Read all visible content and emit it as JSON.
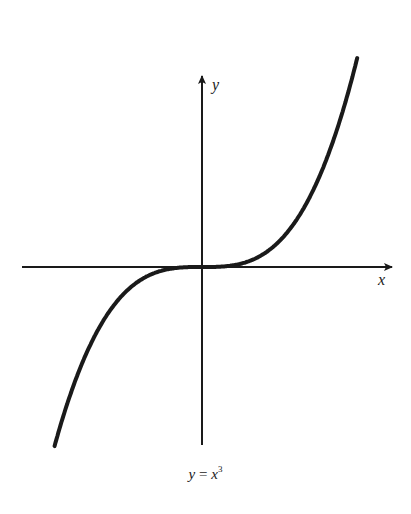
{
  "chart_data": {
    "type": "line",
    "title_parts": {
      "lhs": "y",
      "eq": " = ",
      "base": "x",
      "exp": "3"
    },
    "xlabel": "x",
    "ylabel": "y",
    "function": "y = x^3",
    "grid": false,
    "ticks": false,
    "axes_through_origin": true,
    "x": [
      -1.6,
      -1.2,
      -0.8,
      -0.4,
      0,
      0.4,
      0.8,
      1.2,
      1.6
    ],
    "y": [
      -4.096,
      -1.728,
      -0.512,
      -0.064,
      0,
      0.064,
      0.512,
      1.728,
      4.096
    ],
    "xlim": [
      -1.6,
      1.6
    ],
    "ylim": [
      -4.1,
      4.1
    ]
  },
  "colors": {
    "ink": "#1a1a1a",
    "background": "#ffffff"
  }
}
